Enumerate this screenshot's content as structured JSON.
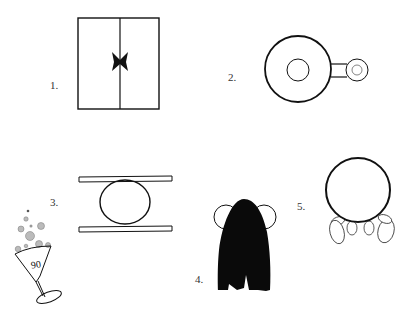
{
  "puzzle": {
    "labels": [
      "1.",
      "2.",
      "3.",
      "4.",
      "5."
    ],
    "glass_number": "90"
  },
  "figures": [
    {
      "id": 1,
      "description": "rectangle split vertically with bow tie at center"
    },
    {
      "id": 2,
      "description": "large circle with inner circle connected to small ring"
    },
    {
      "id": 3,
      "description": "circle squeezed between two horizontal bars"
    },
    {
      "id": 4,
      "description": "black hair-like shape with two circles peeking out"
    },
    {
      "id": 5,
      "description": "circle with four oval feet at bottom"
    }
  ],
  "colors": {
    "ink": "#111111",
    "bubble": "#aaaaaa",
    "background": "#ffffff"
  }
}
